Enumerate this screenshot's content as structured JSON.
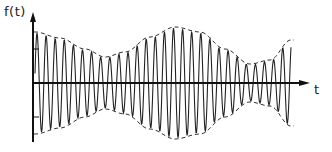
{
  "figure": {
    "y_axis_label": "f(t)",
    "x_axis_label": "t",
    "colors": {
      "ink": "#222222",
      "background": "#ffffff"
    },
    "signal": {
      "x_start": 35,
      "x_end": 291,
      "baseline_y": 83,
      "carrier_period_px": 9.1,
      "envelope_points": [
        [
          35,
          50
        ],
        [
          60,
          44
        ],
        [
          85,
          33
        ],
        [
          105,
          25
        ],
        [
          125,
          30
        ],
        [
          150,
          45
        ],
        [
          175,
          55
        ],
        [
          200,
          50
        ],
        [
          225,
          33
        ],
        [
          250,
          18
        ],
        [
          270,
          22
        ],
        [
          291,
          42
        ]
      ]
    },
    "axes": {
      "origin_x": 33,
      "y_top": 12,
      "y_bottom": 142,
      "x_right": 310
    }
  }
}
